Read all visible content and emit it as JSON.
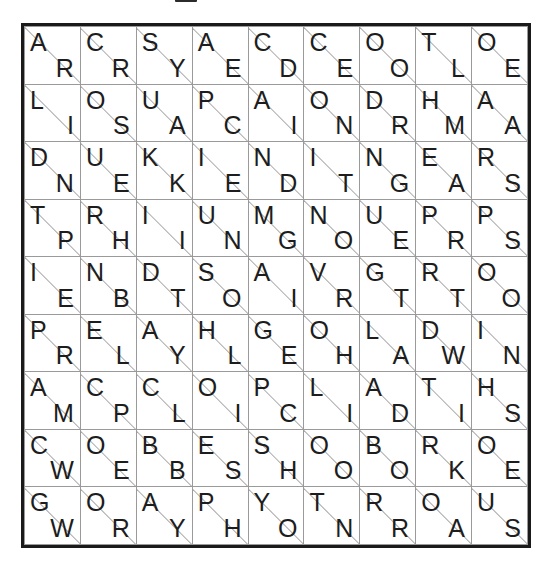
{
  "page": {
    "title": "Split-Cell Letter Grid Puzzle",
    "rows": 9,
    "cols": 9,
    "cell_format": "upper-left letter / lower-right letter separated by diagonal"
  },
  "colors": {
    "background": "#ffffff",
    "thin_line": "#9a9a9a",
    "diagonal_line": "#a8a8a8",
    "thick_line": "#1a1a1a",
    "letter": "#1d1d1d"
  },
  "grid": {
    "upper": [
      [
        "A",
        "C",
        "S",
        "A",
        "C",
        "C",
        "O",
        "T",
        "O"
      ],
      [
        "L",
        "O",
        "U",
        "P",
        "A",
        "O",
        "D",
        "H",
        "A"
      ],
      [
        "D",
        "U",
        "K",
        "I",
        "N",
        "I",
        "N",
        "E",
        "R"
      ],
      [
        "T",
        "R",
        "I",
        "U",
        "M",
        "N",
        "U",
        "P",
        "P"
      ],
      [
        "I",
        "N",
        "D",
        "S",
        "A",
        "V",
        "G",
        "R",
        "O"
      ],
      [
        "P",
        "E",
        "A",
        "H",
        "G",
        "O",
        "L",
        "D",
        "I"
      ],
      [
        "A",
        "C",
        "C",
        "O",
        "P",
        "L",
        "A",
        "T",
        "H"
      ],
      [
        "C",
        "O",
        "B",
        "E",
        "S",
        "O",
        "B",
        "R",
        "O"
      ],
      [
        "G",
        "O",
        "A",
        "P",
        "Y",
        "T",
        "R",
        "O",
        "U"
      ]
    ],
    "lower": [
      [
        "R",
        "R",
        "Y",
        "E",
        "D",
        "E",
        "O",
        "L",
        "E"
      ],
      [
        "I",
        "S",
        "A",
        "C",
        "I",
        "N",
        "R",
        "M",
        "A"
      ],
      [
        "N",
        "E",
        "K",
        "E",
        "D",
        "T",
        "G",
        "A",
        "S"
      ],
      [
        "P",
        "H",
        "I",
        "N",
        "G",
        "O",
        "E",
        "R",
        "S"
      ],
      [
        "E",
        "B",
        "T",
        "O",
        "I",
        "R",
        "T",
        "T",
        "O"
      ],
      [
        "R",
        "L",
        "Y",
        "L",
        "E",
        "H",
        "A",
        "W",
        "N"
      ],
      [
        "M",
        "P",
        "L",
        "I",
        "C",
        "I",
        "D",
        "I",
        "S"
      ],
      [
        "W",
        "E",
        "B",
        "S",
        "H",
        "O",
        "O",
        "K",
        "E"
      ],
      [
        "W",
        "R",
        "Y",
        "H",
        "O",
        "N",
        "R",
        "A",
        "S"
      ]
    ],
    "thick_borders": {
      "description": "per-cell bold cage edges, 0-indexed [row][col] -> sides",
      "cells": [
        {
          "r": 0,
          "c": 0,
          "sides": [
            "right"
          ]
        },
        {
          "r": 0,
          "c": 1,
          "sides": [
            "right"
          ]
        },
        {
          "r": 0,
          "c": 2,
          "sides": [
            "right"
          ]
        },
        {
          "r": 0,
          "c": 5,
          "sides": [
            "right"
          ]
        },
        {
          "r": 1,
          "c": 2,
          "sides": [
            "right"
          ]
        },
        {
          "r": 1,
          "c": 3,
          "sides": [
            "right"
          ]
        },
        {
          "r": 1,
          "c": 5,
          "sides": [
            "right"
          ]
        },
        {
          "r": 1,
          "c": 6,
          "sides": [
            "bottom"
          ]
        },
        {
          "r": 1,
          "c": 7,
          "sides": [
            "bottom"
          ]
        },
        {
          "r": 1,
          "c": 8,
          "sides": [
            "bottom"
          ]
        },
        {
          "r": 2,
          "c": 1,
          "sides": [
            "right"
          ]
        },
        {
          "r": 2,
          "c": 2,
          "sides": [
            "bottom"
          ]
        },
        {
          "r": 2,
          "c": 5,
          "sides": [
            "right"
          ]
        },
        {
          "r": 2,
          "c": 0,
          "sides": [
            "bottom"
          ]
        },
        {
          "r": 2,
          "c": 1,
          "sides": [
            "bottom"
          ]
        },
        {
          "r": 2,
          "c": 3,
          "sides": [
            "bottom"
          ]
        },
        {
          "r": 2,
          "c": 4,
          "sides": [
            "bottom"
          ]
        },
        {
          "r": 2,
          "c": 5,
          "sides": [
            "bottom"
          ]
        },
        {
          "r": 2,
          "c": 6,
          "sides": [
            "bottom"
          ]
        },
        {
          "r": 2,
          "c": 7,
          "sides": [
            "bottom"
          ]
        },
        {
          "r": 2,
          "c": 8,
          "sides": [
            "bottom"
          ]
        },
        {
          "r": 3,
          "c": 5,
          "sides": [
            "left"
          ]
        },
        {
          "r": 3,
          "c": 6,
          "sides": [
            "left"
          ]
        },
        {
          "r": 3,
          "c": 3,
          "sides": [
            "bottom"
          ]
        },
        {
          "r": 3,
          "c": 4,
          "sides": [
            "bottom"
          ]
        },
        {
          "r": 3,
          "c": 7,
          "sides": [
            "bottom"
          ]
        },
        {
          "r": 4,
          "c": 2,
          "sides": [
            "right"
          ]
        },
        {
          "r": 4,
          "c": 6,
          "sides": [
            "left"
          ]
        },
        {
          "r": 4,
          "c": 1,
          "sides": [
            "bottom"
          ]
        },
        {
          "r": 4,
          "c": 6,
          "sides": [
            "bottom"
          ]
        },
        {
          "r": 4,
          "c": 7,
          "sides": [
            "bottom"
          ]
        },
        {
          "r": 5,
          "c": 3,
          "sides": [
            "left"
          ]
        },
        {
          "r": 5,
          "c": 4,
          "sides": [
            "left"
          ]
        },
        {
          "r": 5,
          "c": 0,
          "sides": [
            "bottom"
          ]
        },
        {
          "r": 5,
          "c": 1,
          "sides": [
            "bottom"
          ]
        },
        {
          "r": 5,
          "c": 2,
          "sides": [
            "bottom"
          ]
        },
        {
          "r": 5,
          "c": 3,
          "sides": [
            "bottom"
          ]
        },
        {
          "r": 6,
          "c": 4,
          "sides": [
            "left"
          ]
        },
        {
          "r": 6,
          "c": 7,
          "sides": [
            "left"
          ]
        },
        {
          "r": 6,
          "c": 0,
          "sides": [
            "bottom"
          ]
        },
        {
          "r": 6,
          "c": 2,
          "sides": [
            "bottom"
          ]
        },
        {
          "r": 6,
          "c": 3,
          "sides": [
            "bottom"
          ]
        },
        {
          "r": 7,
          "c": 2,
          "sides": [
            "right"
          ]
        },
        {
          "r": 7,
          "c": 5,
          "sides": [
            "left"
          ]
        },
        {
          "r": 7,
          "c": 6,
          "sides": [
            "left"
          ]
        },
        {
          "r": 7,
          "c": 0,
          "sides": [
            "bottom"
          ]
        },
        {
          "r": 7,
          "c": 3,
          "sides": [
            "bottom"
          ]
        },
        {
          "r": 7,
          "c": 4,
          "sides": [
            "bottom"
          ]
        },
        {
          "r": 7,
          "c": 5,
          "sides": [
            "bottom"
          ]
        },
        {
          "r": 7,
          "c": 6,
          "sides": [
            "bottom"
          ]
        },
        {
          "r": 8,
          "c": 3,
          "sides": [
            "left"
          ]
        },
        {
          "r": 8,
          "c": 6,
          "sides": [
            "left"
          ]
        },
        {
          "r": 8,
          "c": 7,
          "sides": [
            "left"
          ]
        },
        {
          "r": 8,
          "c": 8,
          "sides": [
            "left"
          ]
        }
      ]
    }
  }
}
